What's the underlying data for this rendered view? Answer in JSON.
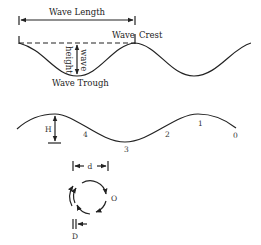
{
  "top_diagram": {
    "wave_length_label": "Wave Length",
    "wave_crest_label_a": "Wave",
    "wave_crest_label_b": "Crest",
    "wave_trough_label": "Wave Trough",
    "wave_height_label_a": "height",
    "wave_height_label_b": "wave"
  },
  "middle_diagram": {
    "height_label": "H",
    "points": [
      "4",
      "3",
      "2",
      "1",
      "0"
    ]
  },
  "bottom_diagram": {
    "diameter_label": "d",
    "orbit_label": "O",
    "drift_label": "D"
  }
}
